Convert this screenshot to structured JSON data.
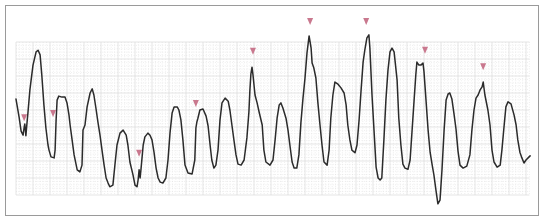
{
  "figure": {
    "grid": {
      "small_box_per_major": 5,
      "major_cols": 30.2,
      "major_rows": 9,
      "minor_style": "dotted",
      "major_color": "#d4d4d4",
      "minor_color": "#dcdcdc"
    },
    "trace_color": "#2b2b2b",
    "marker_color": "#c9788e",
    "frame_color": "#9a9a9a",
    "units": "small grid boxes (x: time, y: amplitude from bottom of grid)",
    "trace": [
      [
        0,
        28.2
      ],
      [
        0.9,
        22.9
      ],
      [
        1.5,
        18.8
      ],
      [
        2.1,
        17.6
      ],
      [
        2.4,
        20
      ],
      [
        2.6,
        20.9
      ],
      [
        2.9,
        17.4
      ],
      [
        3.2,
        20.9
      ],
      [
        3.5,
        24.1
      ],
      [
        4.1,
        30.9
      ],
      [
        5,
        38.2
      ],
      [
        5.9,
        42.1
      ],
      [
        6.5,
        42.6
      ],
      [
        7.1,
        41.2
      ],
      [
        7.6,
        35.3
      ],
      [
        8.2,
        26.5
      ],
      [
        8.8,
        19.7
      ],
      [
        9.4,
        14.7
      ],
      [
        9.7,
        13.2
      ],
      [
        10.3,
        11.2
      ],
      [
        11.2,
        10.9
      ],
      [
        11.5,
        13.2
      ],
      [
        11.8,
        22.1
      ],
      [
        12.1,
        27.9
      ],
      [
        12.6,
        29.1
      ],
      [
        13.5,
        28.8
      ],
      [
        14.4,
        28.8
      ],
      [
        15,
        27.1
      ],
      [
        15.6,
        23.5
      ],
      [
        15.9,
        20.6
      ],
      [
        16.5,
        16.2
      ],
      [
        17.1,
        11.8
      ],
      [
        18,
        7.4
      ],
      [
        18.8,
        6.8
      ],
      [
        19.4,
        8.8
      ],
      [
        19.7,
        19.1
      ],
      [
        20.3,
        20.6
      ],
      [
        20.9,
        25.9
      ],
      [
        21.8,
        30
      ],
      [
        22.4,
        31.2
      ],
      [
        22.9,
        29.4
      ],
      [
        23.5,
        25.6
      ],
      [
        24.1,
        21.5
      ],
      [
        24.7,
        17.6
      ],
      [
        25.3,
        13.2
      ],
      [
        25.9,
        8.8
      ],
      [
        26.5,
        5
      ],
      [
        27.1,
        3.5
      ],
      [
        27.6,
        2.4
      ],
      [
        28.5,
        2.9
      ],
      [
        29.1,
        8.8
      ],
      [
        29.7,
        14.7
      ],
      [
        30.6,
        18.2
      ],
      [
        31.5,
        19.1
      ],
      [
        32.4,
        17.6
      ],
      [
        32.9,
        14.7
      ],
      [
        33.5,
        9.7
      ],
      [
        34.4,
        5.9
      ],
      [
        35,
        2.9
      ],
      [
        35.6,
        2.4
      ],
      [
        35.9,
        4.4
      ],
      [
        36.2,
        7.4
      ],
      [
        36.5,
        5
      ],
      [
        36.8,
        7.9
      ],
      [
        37.4,
        14.7
      ],
      [
        37.9,
        17.1
      ],
      [
        38.8,
        18.2
      ],
      [
        39.4,
        17.6
      ],
      [
        40,
        16.2
      ],
      [
        40.6,
        12.6
      ],
      [
        41.2,
        7.9
      ],
      [
        41.8,
        5
      ],
      [
        42.4,
        3.8
      ],
      [
        43.2,
        3.5
      ],
      [
        44.1,
        5
      ],
      [
        44.7,
        10.3
      ],
      [
        45.3,
        18.2
      ],
      [
        45.9,
        24.1
      ],
      [
        46.5,
        25.9
      ],
      [
        47.4,
        25.9
      ],
      [
        47.9,
        25
      ],
      [
        48.5,
        22.1
      ],
      [
        49.1,
        16.2
      ],
      [
        49.7,
        8.8
      ],
      [
        50.6,
        6.5
      ],
      [
        51.8,
        6.2
      ],
      [
        52.6,
        10.3
      ],
      [
        52.9,
        19.7
      ],
      [
        53.2,
        21.5
      ],
      [
        53.5,
        22.6
      ],
      [
        54.1,
        25
      ],
      [
        55,
        25.3
      ],
      [
        55.9,
        23.2
      ],
      [
        56.5,
        20.3
      ],
      [
        57.1,
        14.7
      ],
      [
        57.6,
        10.3
      ],
      [
        58.2,
        7.9
      ],
      [
        58.8,
        8.8
      ],
      [
        59.4,
        13.2
      ],
      [
        60,
        22.1
      ],
      [
        60.6,
        27.1
      ],
      [
        61.5,
        28.5
      ],
      [
        62.4,
        27.6
      ],
      [
        62.9,
        25
      ],
      [
        63.5,
        20.6
      ],
      [
        64.1,
        16.2
      ],
      [
        64.7,
        11.8
      ],
      [
        65.3,
        9.1
      ],
      [
        66.2,
        8.8
      ],
      [
        67.1,
        10.3
      ],
      [
        67.9,
        16.8
      ],
      [
        68.5,
        24.4
      ],
      [
        68.8,
        30.9
      ],
      [
        69.1,
        35.6
      ],
      [
        69.4,
        37.6
      ],
      [
        69.7,
        35.3
      ],
      [
        70.3,
        29.4
      ],
      [
        70.9,
        27.1
      ],
      [
        71.5,
        24.4
      ],
      [
        72.4,
        20.6
      ],
      [
        72.9,
        13.2
      ],
      [
        73.5,
        9.7
      ],
      [
        74.7,
        8.8
      ],
      [
        75.6,
        10.3
      ],
      [
        76.2,
        16.2
      ],
      [
        76.8,
        22.6
      ],
      [
        77.4,
        26.5
      ],
      [
        77.9,
        27.1
      ],
      [
        78.5,
        25.6
      ],
      [
        79.4,
        22.6
      ],
      [
        80,
        19.1
      ],
      [
        80.6,
        14.4
      ],
      [
        81.2,
        9.7
      ],
      [
        81.8,
        7.9
      ],
      [
        82.6,
        7.9
      ],
      [
        83.2,
        11.8
      ],
      [
        83.8,
        21.2
      ],
      [
        84.4,
        28.5
      ],
      [
        85,
        34.4
      ],
      [
        85.6,
        41.8
      ],
      [
        86.2,
        46.8
      ],
      [
        86.8,
        43.2
      ],
      [
        87.1,
        38.8
      ],
      [
        87.6,
        37.4
      ],
      [
        88.2,
        34.4
      ],
      [
        88.8,
        27.1
      ],
      [
        89.4,
        20.6
      ],
      [
        90,
        14.7
      ],
      [
        90.6,
        9.7
      ],
      [
        91.5,
        8.8
      ],
      [
        92.1,
        13.2
      ],
      [
        92.6,
        22.6
      ],
      [
        93.2,
        29.4
      ],
      [
        93.8,
        33.2
      ],
      [
        94.7,
        32.6
      ],
      [
        95.6,
        31.5
      ],
      [
        96.5,
        30
      ],
      [
        97.1,
        26.5
      ],
      [
        97.6,
        20.6
      ],
      [
        98.2,
        16.2
      ],
      [
        98.8,
        13.2
      ],
      [
        99.7,
        12.4
      ],
      [
        100.3,
        14.7
      ],
      [
        100.9,
        22.1
      ],
      [
        101.5,
        30.9
      ],
      [
        102.1,
        39.1
      ],
      [
        102.6,
        42.6
      ],
      [
        103.2,
        46.2
      ],
      [
        103.8,
        47.1
      ],
      [
        104.1,
        43.2
      ],
      [
        104.7,
        29.4
      ],
      [
        105.3,
        19.1
      ],
      [
        105.9,
        8.2
      ],
      [
        106.5,
        5
      ],
      [
        107.1,
        4.4
      ],
      [
        107.6,
        5
      ],
      [
        108.2,
        16.2
      ],
      [
        108.8,
        27.9
      ],
      [
        109.4,
        36.8
      ],
      [
        110,
        42.1
      ],
      [
        110.6,
        43.2
      ],
      [
        111.2,
        42.1
      ],
      [
        112.1,
        33.8
      ],
      [
        112.6,
        22.6
      ],
      [
        113.2,
        14.7
      ],
      [
        113.8,
        9.1
      ],
      [
        114.4,
        7.9
      ],
      [
        115.3,
        7.6
      ],
      [
        115.9,
        10.3
      ],
      [
        116.5,
        19.1
      ],
      [
        117.1,
        27.9
      ],
      [
        117.6,
        35.3
      ],
      [
        117.9,
        39.1
      ],
      [
        118.5,
        38.2
      ],
      [
        119.1,
        38.2
      ],
      [
        119.7,
        38.8
      ],
      [
        120,
        36.2
      ],
      [
        120.6,
        27.9
      ],
      [
        121.2,
        19.1
      ],
      [
        121.8,
        12.6
      ],
      [
        122.4,
        8.8
      ],
      [
        122.9,
        5.9
      ],
      [
        123.5,
        1.5
      ],
      [
        124.1,
        -2.6
      ],
      [
        124.7,
        -1.5
      ],
      [
        125.3,
        7.4
      ],
      [
        125.9,
        19.1
      ],
      [
        126.5,
        27.9
      ],
      [
        127.1,
        29.7
      ],
      [
        127.6,
        30
      ],
      [
        128.2,
        28.2
      ],
      [
        128.8,
        24.1
      ],
      [
        129.4,
        19.4
      ],
      [
        130,
        12.9
      ],
      [
        130.6,
        8.8
      ],
      [
        131.5,
        7.9
      ],
      [
        132.6,
        8.5
      ],
      [
        133.5,
        11.8
      ],
      [
        134.1,
        19.1
      ],
      [
        134.7,
        25
      ],
      [
        135.3,
        28.5
      ],
      [
        135.9,
        29.4
      ],
      [
        136.5,
        30.9
      ],
      [
        137.1,
        31.8
      ],
      [
        137.4,
        33.2
      ],
      [
        137.9,
        29.4
      ],
      [
        138.8,
        25
      ],
      [
        139.4,
        20.6
      ],
      [
        140,
        13.2
      ],
      [
        140.6,
        9.7
      ],
      [
        141.5,
        8.2
      ],
      [
        142.4,
        8.8
      ],
      [
        142.9,
        13.2
      ],
      [
        143.5,
        19.7
      ],
      [
        144.1,
        25.9
      ],
      [
        144.7,
        27.4
      ],
      [
        145.6,
        26.8
      ],
      [
        146.5,
        23.5
      ],
      [
        147.1,
        20.6
      ],
      [
        147.6,
        16.2
      ],
      [
        148.2,
        12.6
      ],
      [
        148.8,
        10.9
      ],
      [
        149.4,
        9.4
      ],
      [
        150,
        10.3
      ],
      [
        150.9,
        11.2
      ],
      [
        151.2,
        11.5
      ]
    ],
    "markers": [
      {
        "x": 2.4,
        "y": 22.6
      },
      {
        "x": 10.9,
        "y": 23.8
      },
      {
        "x": 36.2,
        "y": 12.1
      },
      {
        "x": 52.9,
        "y": 26.8
      },
      {
        "x": 69.7,
        "y": 42.1
      },
      {
        "x": 86.5,
        "y": 50.9
      },
      {
        "x": 103,
        "y": 50.9
      },
      {
        "x": 120.3,
        "y": 42.4
      },
      {
        "x": 137.4,
        "y": 37.6
      }
    ]
  }
}
